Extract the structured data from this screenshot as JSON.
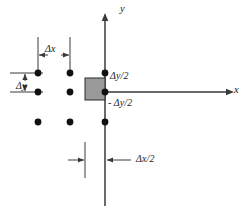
{
  "figure": {
    "background_color": "#ffffff",
    "line_color": "#3a3a3a",
    "dot_color": "#111111",
    "shade_fill": "#9a9a9a",
    "shade_stroke": "#2b2b2b",
    "axes": {
      "x_label": "x",
      "y_label": "y",
      "origin": {
        "x": 105,
        "y": 92
      },
      "x_axis": {
        "x1": 105,
        "y1": 92,
        "x2": 232,
        "y2": 92
      },
      "y_axis": {
        "x1": 105,
        "y1": 18,
        "x2": 105,
        "y2": 206
      }
    },
    "control_volume": {
      "name": "half-cell",
      "x": 85,
      "y": 78,
      "width": 20,
      "height": 22,
      "fill": "#9a9a9a"
    },
    "grid_dots": [
      {
        "x": 38,
        "y": 73
      },
      {
        "x": 70,
        "y": 73
      },
      {
        "x": 105,
        "y": 73
      },
      {
        "x": 38,
        "y": 92
      },
      {
        "x": 70,
        "y": 92
      },
      {
        "x": 105,
        "y": 92
      },
      {
        "x": 38,
        "y": 122
      },
      {
        "x": 70,
        "y": 122
      },
      {
        "x": 105,
        "y": 122
      }
    ],
    "annotations": {
      "delta_x": {
        "label": "Δx",
        "label_x": 45,
        "label_y": 50,
        "extension_left_x": 38,
        "extension_right_x": 70,
        "extension_top_y": 37,
        "extension_bottom_y": 75,
        "arrow_y": 55
      },
      "delta_y": {
        "label": "Δy",
        "label_x": 16,
        "label_y": 87,
        "extension_top_y": 73,
        "extension_bottom_y": 92,
        "extension_left_x": 10,
        "extension_right_x": 43,
        "arrow_x": 25
      },
      "delta_y_half_top": {
        "label": "Δy/2",
        "label_x": 110,
        "label_y": 77
      },
      "delta_y_half_bottom": {
        "label": "- Δy/2",
        "label_x": 108,
        "label_y": 104
      },
      "delta_x_half": {
        "label": "Δx/2",
        "label_x": 138,
        "label_y": 162,
        "tick_left_x": 85,
        "tick_right_x": 105,
        "tick_top_y": 140,
        "tick_bottom_y": 178,
        "arrow_y": 160
      }
    }
  }
}
